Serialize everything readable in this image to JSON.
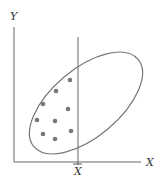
{
  "diagram": {
    "y_axis_label": "Y",
    "x_axis_label": "X",
    "mean_label": "X",
    "colors": {
      "line": "#666666",
      "dot": "#777777"
    },
    "points": [
      [
        70,
        80
      ],
      [
        56,
        91
      ],
      [
        43,
        104
      ],
      [
        68,
        109
      ],
      [
        37,
        120
      ],
      [
        55,
        121
      ],
      [
        43,
        134
      ],
      [
        55,
        139
      ],
      [
        71,
        131
      ]
    ]
  }
}
